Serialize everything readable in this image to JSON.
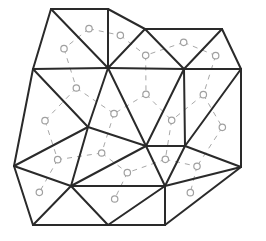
{
  "diagram": {
    "type": "triangulated-mesh-with-dual-graph",
    "colors": {
      "mesh_edges": "#2a2a2a",
      "dual_edges": "#a8a8a8",
      "background": "#ffffff"
    },
    "vertices": {
      "A": [
        51,
        9
      ],
      "B": [
        108,
        9
      ],
      "C": [
        145,
        29
      ],
      "D": [
        222,
        29
      ],
      "E": [
        241,
        69
      ],
      "F": [
        33,
        69
      ],
      "G": [
        108,
        68
      ],
      "H": [
        184,
        69
      ],
      "I": [
        88,
        127
      ],
      "J": [
        146,
        146
      ],
      "K": [
        185,
        146
      ],
      "L": [
        241,
        167
      ],
      "M": [
        14,
        166
      ],
      "N": [
        71,
        186
      ],
      "O": [
        165,
        186
      ],
      "P": [
        33,
        225
      ],
      "Q": [
        108,
        225
      ],
      "R": [
        165,
        225
      ]
    },
    "edges": [
      [
        "A",
        "B"
      ],
      [
        "B",
        "C"
      ],
      [
        "C",
        "D"
      ],
      [
        "D",
        "E"
      ],
      [
        "E",
        "L"
      ],
      [
        "L",
        "R"
      ],
      [
        "R",
        "P"
      ],
      [
        "P",
        "M"
      ],
      [
        "M",
        "F"
      ],
      [
        "F",
        "A"
      ],
      [
        "A",
        "G"
      ],
      [
        "B",
        "G"
      ],
      [
        "C",
        "G"
      ],
      [
        "C",
        "H"
      ],
      [
        "D",
        "H"
      ],
      [
        "F",
        "G"
      ],
      [
        "G",
        "H"
      ],
      [
        "H",
        "E"
      ],
      [
        "F",
        "I"
      ],
      [
        "G",
        "I"
      ],
      [
        "G",
        "J"
      ],
      [
        "H",
        "J"
      ],
      [
        "H",
        "K"
      ],
      [
        "E",
        "K"
      ],
      [
        "I",
        "J"
      ],
      [
        "J",
        "K"
      ],
      [
        "K",
        "L"
      ],
      [
        "I",
        "M"
      ],
      [
        "I",
        "N"
      ],
      [
        "M",
        "N"
      ],
      [
        "J",
        "N"
      ],
      [
        "J",
        "O"
      ],
      [
        "K",
        "O"
      ],
      [
        "L",
        "O"
      ],
      [
        "N",
        "O"
      ],
      [
        "N",
        "P"
      ],
      [
        "N",
        "Q"
      ],
      [
        "Q",
        "O"
      ],
      [
        "O",
        "R"
      ]
    ]
  }
}
